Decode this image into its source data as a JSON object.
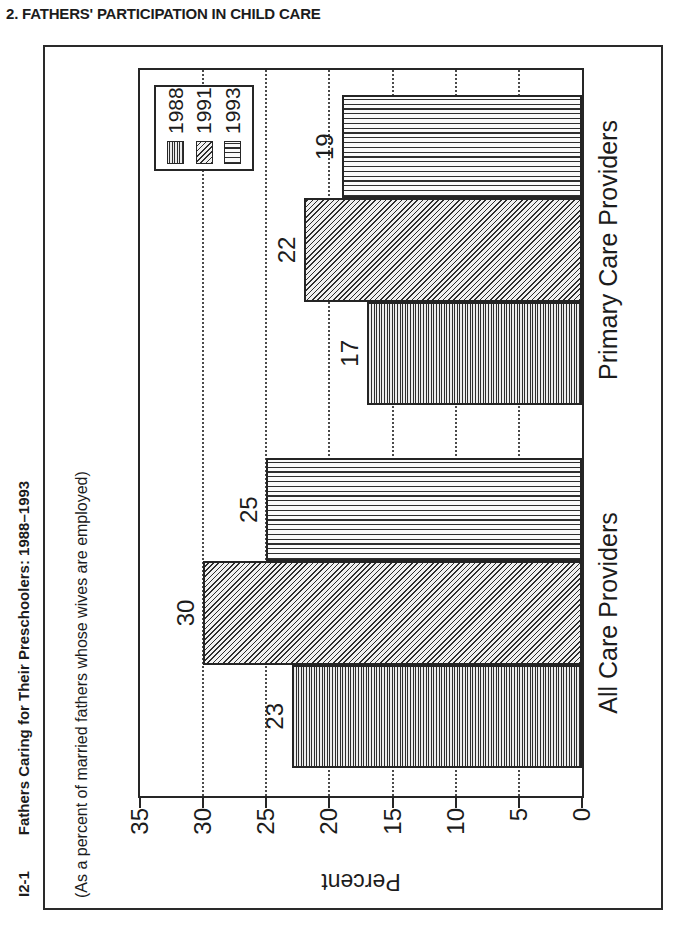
{
  "page": {
    "header": "2. FATHERS' PARTICIPATION IN CHILD CARE"
  },
  "figure": {
    "id": "I2-1",
    "title": "Fathers Caring for Their Preschoolers: 1988–1993",
    "subtitle": "(As a percent of married fathers whose wives are employed)",
    "rotation_on_page_deg": -90
  },
  "chart_data": {
    "type": "bar",
    "categories": [
      "All Care Providers",
      "Primary Care Providers"
    ],
    "series": [
      {
        "name": "1988",
        "pattern": "fine-parallel-lines",
        "values": [
          23,
          17
        ]
      },
      {
        "name": "1991",
        "pattern": "diagonal-hatch",
        "values": [
          30,
          22
        ]
      },
      {
        "name": "1993",
        "pattern": "wide-parallel-lines",
        "values": [
          25,
          19
        ]
      }
    ],
    "title": "Fathers Caring for Their Preschoolers: 1988–1993",
    "xlabel": "",
    "ylabel": "Percent",
    "ylim": [
      0,
      35
    ],
    "yticks": [
      0,
      5,
      10,
      15,
      20,
      25,
      30,
      35
    ],
    "grid": "dotted, at ticks 5-30",
    "legend_position": "top-right",
    "bar_labels": true
  },
  "colors": {
    "ink": "#1c1c1c",
    "background": "#ffffff"
  }
}
